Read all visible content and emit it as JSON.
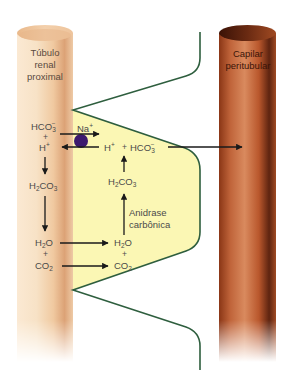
{
  "diagram": {
    "type": "renal bicarbonate reabsorption schematic",
    "colors": {
      "tubule_light": "#f6dcc0",
      "tubule_dark": "#d9a070",
      "cell_fill": "#fbf7b4",
      "cell_border": "#2e5e3e",
      "capillary_light": "#c86a3c",
      "capillary_dark": "#6e2a12",
      "arrow": "#1a1a1a",
      "transporter": "#3c1a6e",
      "text": "#4a4a4a"
    },
    "structures": {
      "tubule": {
        "label_line1": "Túbulo",
        "label_line2": "renal",
        "label_line3": "proximal"
      },
      "capillary": {
        "label_line1": "Capilar",
        "label_line2": "peritubular"
      }
    },
    "lumen": {
      "hco3": {
        "base": "HCO",
        "sub": "3",
        "sup": "−"
      },
      "plus1": "+",
      "h": {
        "base": "H",
        "sup": "+"
      },
      "h2co3": {
        "pre": "H",
        "sub1": "2",
        "post": "CO",
        "sub2": "3"
      },
      "h2o": {
        "pre": "H",
        "sub": "2",
        "post": "O"
      },
      "plus2": "+",
      "co2": {
        "pre": "CO",
        "sub": "2"
      }
    },
    "cell": {
      "na": {
        "base": "Na",
        "sup": "+"
      },
      "h": {
        "base": "H",
        "sup": "+"
      },
      "plus_mid": "+",
      "hco3": {
        "base": "HCO",
        "sub": "3",
        "sup": "−"
      },
      "h2co3": {
        "pre": "H",
        "sub1": "2",
        "post": "CO",
        "sub2": "3"
      },
      "enzyme_line1": "Anidrase",
      "enzyme_line2": "carbônica",
      "h2o": {
        "pre": "H",
        "sub": "2",
        "post": "O"
      },
      "plus": "+",
      "co2": {
        "pre": "CO",
        "sub": "2"
      }
    }
  }
}
